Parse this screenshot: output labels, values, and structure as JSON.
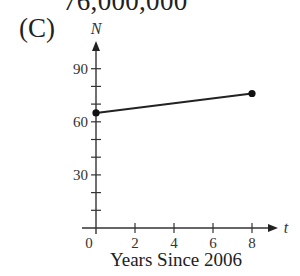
{
  "header": {
    "clipped_caption": "76,000,000",
    "choice_label": "(C)"
  },
  "chart_data": {
    "type": "line",
    "title": "",
    "xlabel": "Years Since 2006",
    "ylabel": "N",
    "x_axis_variable": "t",
    "y_axis_variable": "N",
    "x": [
      0,
      8
    ],
    "series": [
      {
        "name": "N",
        "values": [
          65,
          76
        ]
      }
    ],
    "points": [
      {
        "x": 0,
        "y": 65
      },
      {
        "x": 8,
        "y": 76
      }
    ],
    "x_ticks": [
      0,
      2,
      4,
      6,
      8
    ],
    "x_tick_labels": [
      "0",
      "2",
      "4",
      "6",
      "8"
    ],
    "y_ticks": [
      10,
      20,
      30,
      40,
      50,
      60,
      70,
      80,
      90
    ],
    "y_tick_labels": {
      "30": "30",
      "60": "60",
      "90": "90"
    },
    "xlim": [
      0,
      9
    ],
    "ylim": [
      0,
      100
    ],
    "grid": false,
    "legend": "none",
    "markers": "filled circles at endpoints"
  },
  "labels": {
    "y0": "0",
    "y30": "30",
    "y60": "60",
    "y90": "90",
    "x2": "2",
    "x4": "4",
    "x6": "6",
    "x8": "8",
    "y_var": "N",
    "x_var": "t",
    "x_axis_title": "Years Since 2006"
  }
}
